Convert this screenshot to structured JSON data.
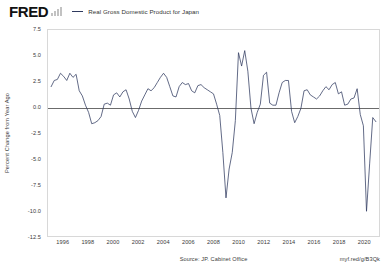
{
  "header": {
    "logo_text": "FRED",
    "logo_icon": "bar-chart-icon",
    "legend": {
      "label": "Real Gross Domestic Product for Japan",
      "color": "#2f3a5f"
    }
  },
  "footer": {
    "source": "Source: JP. Cabinet Office",
    "url": "myf.red/g/B3Qk"
  },
  "chart_data": {
    "type": "line",
    "title": "",
    "subtitle": "",
    "xlabel": "",
    "ylabel": "Percent Change from Year Ago",
    "legend_position": "top",
    "grid": false,
    "zero_line": true,
    "xlim": [
      1994.75,
      2021.25
    ],
    "ylim": [
      -12.5,
      7.5
    ],
    "ytick_labels": [
      "7.5",
      "5.0",
      "2.5",
      "0.0",
      "-2.5",
      "-5.0",
      "-7.5",
      "-10.0",
      "-12.5"
    ],
    "yticks": [
      7.5,
      5.0,
      2.5,
      0.0,
      -2.5,
      -5.0,
      -7.5,
      -10.0,
      -12.5
    ],
    "xtick_labels": [
      "1996",
      "1998",
      "2000",
      "2002",
      "2004",
      "2006",
      "2008",
      "2010",
      "2012",
      "2014",
      "2016",
      "2018",
      "2020"
    ],
    "xticks": [
      1996,
      1998,
      2000,
      2002,
      2004,
      2006,
      2008,
      2010,
      2012,
      2014,
      2016,
      2018,
      2020
    ],
    "series": [
      {
        "name": "Real Gross Domestic Product for Japan",
        "color": "#2f3a5f",
        "units": "Percent Change from Year Ago",
        "frequency": "Quarterly",
        "x": [
          1995.0,
          1995.25,
          1995.5,
          1995.75,
          1996.0,
          1996.25,
          1996.5,
          1996.75,
          1997.0,
          1997.25,
          1997.5,
          1997.75,
          1998.0,
          1998.25,
          1998.5,
          1998.75,
          1999.0,
          1999.25,
          1999.5,
          1999.75,
          2000.0,
          2000.25,
          2000.5,
          2000.75,
          2001.0,
          2001.25,
          2001.5,
          2001.75,
          2002.0,
          2002.25,
          2002.5,
          2002.75,
          2003.0,
          2003.25,
          2003.5,
          2003.75,
          2004.0,
          2004.25,
          2004.5,
          2004.75,
          2005.0,
          2005.25,
          2005.5,
          2005.75,
          2006.0,
          2006.25,
          2006.5,
          2006.75,
          2007.0,
          2007.25,
          2007.5,
          2007.75,
          2008.0,
          2008.25,
          2008.5,
          2008.75,
          2009.0,
          2009.25,
          2009.5,
          2009.75,
          2010.0,
          2010.25,
          2010.5,
          2010.75,
          2011.0,
          2011.25,
          2011.5,
          2011.75,
          2012.0,
          2012.25,
          2012.5,
          2012.75,
          2013.0,
          2013.25,
          2013.5,
          2013.75,
          2014.0,
          2014.25,
          2014.5,
          2014.75,
          2015.0,
          2015.25,
          2015.5,
          2015.75,
          2016.0,
          2016.25,
          2016.5,
          2016.75,
          2017.0,
          2017.25,
          2017.5,
          2017.75,
          2018.0,
          2018.25,
          2018.5,
          2018.75,
          2019.0,
          2019.25,
          2019.5,
          2019.75,
          2020.0,
          2020.25,
          2020.5,
          2020.75,
          2021.0
        ],
        "values": [
          2.0,
          2.6,
          2.7,
          3.3,
          3.0,
          2.6,
          3.3,
          2.9,
          3.2,
          1.6,
          1.1,
          0.2,
          -0.5,
          -1.6,
          -1.5,
          -1.3,
          -0.9,
          0.3,
          0.4,
          0.2,
          1.2,
          1.4,
          1.0,
          1.5,
          1.7,
          0.8,
          -0.4,
          -1.0,
          -0.3,
          0.6,
          1.2,
          1.8,
          1.6,
          1.9,
          2.4,
          2.9,
          3.3,
          2.9,
          2.0,
          1.1,
          1.0,
          2.0,
          2.4,
          2.2,
          2.3,
          1.6,
          1.4,
          2.1,
          2.2,
          1.9,
          1.7,
          1.5,
          1.3,
          0.3,
          -0.8,
          -4.4,
          -8.8,
          -6.0,
          -4.4,
          -1.3,
          5.3,
          4.0,
          5.5,
          3.5,
          -0.1,
          -1.6,
          -0.5,
          0.3,
          3.1,
          3.4,
          0.4,
          0.2,
          0.2,
          1.4,
          2.4,
          2.6,
          2.6,
          -0.4,
          -1.5,
          -0.9,
          -0.1,
          1.6,
          1.7,
          1.2,
          1.0,
          0.8,
          1.1,
          1.6,
          2.0,
          1.7,
          2.2,
          2.4,
          1.3,
          1.5,
          0.2,
          0.3,
          0.8,
          0.9,
          1.8,
          -0.7,
          -1.8,
          -10.1,
          -5.5,
          -1.0,
          -1.4
        ]
      }
    ]
  }
}
